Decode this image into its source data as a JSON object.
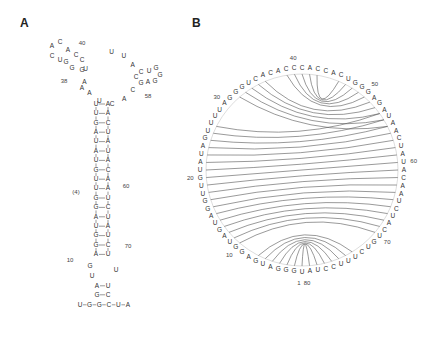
{
  "panels": {
    "a": {
      "label": "A",
      "title": "secondary structure (2D)"
    },
    "b": {
      "label": "B",
      "title": "circle plot (arc diagram)"
    }
  },
  "sequence": "UGGGAUGAGGUAGUAGGUUGUAUAGUUUUAGGGUCACACCCACCACUGGGAGAUAACUAUACAAUCUACUGUCUUUCCUA",
  "stem": {
    "left": [
      "U",
      "U",
      "G",
      "A",
      "U",
      "A",
      "U",
      "G",
      "U",
      "U",
      "G",
      "G",
      "A",
      "U",
      "G",
      "G",
      "A"
    ],
    "right": [
      "A",
      "A",
      "C",
      "U",
      "A",
      "U",
      "A",
      "C",
      "A",
      "A",
      "U",
      "C",
      "U",
      "A",
      "U",
      "C",
      "U"
    ]
  },
  "positions": {
    "p10": "10",
    "p20": "20",
    "p30": "30",
    "p38": "38",
    "p40": "40",
    "p50": "50",
    "p58": "58",
    "p60": "60",
    "p70": "70",
    "p1": "1",
    "p80": "80"
  },
  "tail": [
    "U",
    "G",
    "G",
    "C",
    "U",
    "A"
  ]
}
